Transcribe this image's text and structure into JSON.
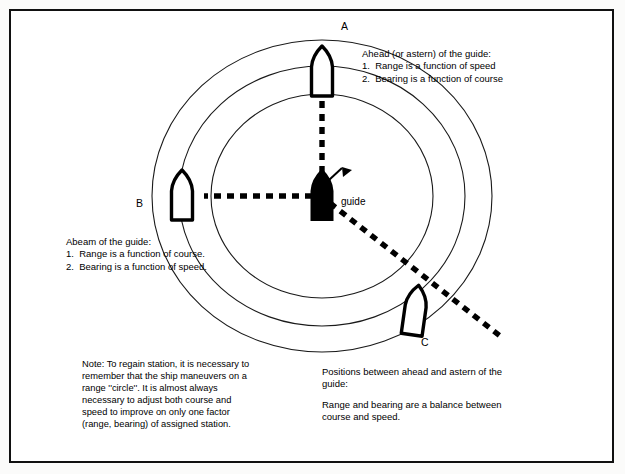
{
  "figure": {
    "frame_color": "#111111",
    "background": "#ffffff",
    "line_color": "#1a1a1a"
  },
  "labels": {
    "ship_a": "A",
    "ship_b": "B",
    "ship_c": "C",
    "guide": "guide"
  },
  "callouts": {
    "ahead": {
      "heading": "Ahead (or astern) of the guide:",
      "item1": "1.  Range is a function of speed",
      "item2": "2.  Bearing is a function of course"
    },
    "abeam": {
      "heading": "Abeam of the guide:",
      "item1": "1.  Range is a function of course.",
      "item2": "2.  Bearing is a function of speed."
    },
    "note": {
      "line1": "Note: To regain station, it is necessary to",
      "line2": "remember that the ship maneuvers on a",
      "line3": "range ''circle''. It is almost always",
      "line4": "necessary to adjust both course and",
      "line5": "speed to improve on only one factor",
      "line6": "(range, bearing) of assigned station."
    },
    "between": {
      "line1": "Positions between ahead and astern of the",
      "line2": "guide:",
      "line3": "Range and bearing are a balance between",
      "line4": "course and speed."
    }
  },
  "geometry": {
    "center_x": 322,
    "center_y": 196,
    "range_circles": [
      {
        "name": "inner-range-circle",
        "rx": 111,
        "ry": 102
      },
      {
        "name": "middle-range-circle",
        "rx": 143,
        "ry": 130
      },
      {
        "name": "outer-range-circle",
        "rx": 170,
        "ry": 156
      }
    ],
    "bearing_lines": [
      {
        "name": "bearing-line-a",
        "from": [
          322,
          196
        ],
        "to": [
          322,
          103
        ],
        "style": "dashed"
      },
      {
        "name": "bearing-line-b",
        "from": [
          322,
          196
        ],
        "to": [
          206,
          196
        ],
        "style": "dashed"
      },
      {
        "name": "bearing-line-c",
        "from": [
          322,
          196
        ],
        "to": [
          500,
          335
        ],
        "style": "dashed"
      }
    ],
    "ships": [
      {
        "name": "ship-a",
        "x": 322,
        "y": 72,
        "rotation": 0,
        "fill": "white"
      },
      {
        "name": "ship-b",
        "x": 182,
        "y": 196,
        "rotation": 0,
        "fill": "white"
      },
      {
        "name": "ship-c",
        "x": 415,
        "y": 311,
        "rotation": 8,
        "fill": "white"
      },
      {
        "name": "guide-ship",
        "x": 322,
        "y": 196,
        "rotation": 0,
        "fill": "black"
      }
    ]
  }
}
